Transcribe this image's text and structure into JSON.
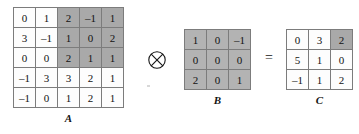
{
  "operators": {
    "convolution": {
      "name": "circled-times",
      "glyph": "⊗"
    },
    "equals": {
      "name": "equals",
      "glyph": "="
    }
  },
  "colors": {
    "background": "#ffffff",
    "cell_fill": "#fdfdfd",
    "cell_border": "#7c7c7c",
    "highlight_a": "#a9a9a9",
    "highlight_b": "#b3b3b3",
    "text": "#121212"
  },
  "matrices": {
    "a": {
      "label": "A",
      "rows": 5,
      "cols": 5,
      "values": [
        [
          "0",
          "1",
          "2",
          "–1",
          "1"
        ],
        [
          "3",
          "–1",
          "1",
          "0",
          "2"
        ],
        [
          "0",
          "0",
          "2",
          "1",
          "1"
        ],
        [
          "–1",
          "3",
          "3",
          "2",
          "1"
        ],
        [
          "–1",
          "0",
          "1",
          "2",
          "1"
        ]
      ],
      "shaded": [
        [
          false,
          false,
          true,
          true,
          true
        ],
        [
          false,
          false,
          true,
          true,
          true
        ],
        [
          false,
          false,
          true,
          true,
          true
        ],
        [
          false,
          false,
          false,
          false,
          false
        ],
        [
          false,
          false,
          false,
          false,
          false
        ]
      ]
    },
    "b": {
      "label": "B",
      "rows": 3,
      "cols": 3,
      "values": [
        [
          "1",
          "0",
          "–1"
        ],
        [
          "0",
          "0",
          "0"
        ],
        [
          "2",
          "0",
          "1"
        ]
      ],
      "shaded": [
        [
          true,
          true,
          true
        ],
        [
          true,
          true,
          true
        ],
        [
          true,
          true,
          true
        ]
      ]
    },
    "c": {
      "label": "C",
      "rows": 3,
      "cols": 3,
      "values": [
        [
          "0",
          "3",
          "2"
        ],
        [
          "5",
          "1",
          "0"
        ],
        [
          "–1",
          "1",
          "2"
        ]
      ],
      "shaded": [
        [
          false,
          false,
          true
        ],
        [
          false,
          false,
          false
        ],
        [
          false,
          false,
          false
        ]
      ]
    }
  }
}
